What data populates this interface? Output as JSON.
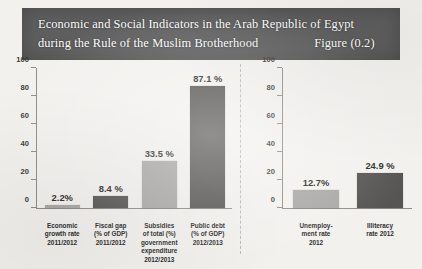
{
  "header": {
    "title_line1": "Economic and Social Indicators in the Arab Republic of Egypt",
    "title_line2": "during the Rule of the Muslim Brotherhood",
    "figure_label": "Figure (0.2)",
    "banner_color": "#5e5e5e",
    "text_color": "#ffffff"
  },
  "palette": {
    "light_bar": "#a9a8a5",
    "dark_bar": "#565553",
    "axis": "#8e8d8a",
    "page_background": "#f2f1ee"
  },
  "chart_data": [
    {
      "type": "bar",
      "id": "left-chart",
      "title": "",
      "xlabel": "",
      "ylabel": "",
      "ylim": [
        0,
        100
      ],
      "yticks": [
        0,
        20,
        40,
        60,
        80,
        100
      ],
      "grid": false,
      "legend": "none",
      "categories": [
        "Economic growth rate 2011/2012",
        "Fiscal gap (% of GDP) 2011/2012",
        "Subsidies of total (%) government expenditure 2012/2013",
        "Public debt (% of GDP) 2012/2013"
      ],
      "category_lines": [
        [
          "Economic",
          "growth rate",
          "2011/2012"
        ],
        [
          "Fiscal gap",
          "(% of GDP)",
          "2011/2012"
        ],
        [
          "Subsidies",
          "of total (%)",
          "government",
          "expenditure",
          "2012/2013"
        ],
        [
          "Public debt",
          "(% of GDP)",
          "2012/2013"
        ]
      ],
      "values": [
        2.2,
        8.4,
        33.5,
        87.1
      ],
      "value_labels": [
        "2.2%",
        "8.4 %",
        "33.5 %",
        "87.1 %"
      ],
      "bar_shades": [
        "light",
        "dark",
        "light",
        "dark"
      ]
    },
    {
      "type": "bar",
      "id": "right-chart",
      "title": "",
      "xlabel": "",
      "ylabel": "",
      "ylim": [
        0,
        100
      ],
      "yticks": [
        0,
        20,
        40,
        60,
        80,
        100
      ],
      "grid": false,
      "legend": "none",
      "categories": [
        "Unemployment rate 2012",
        "Illiteracy rate 2012"
      ],
      "category_lines": [
        [
          "Unemploy-",
          "ment rate",
          "2012"
        ],
        [
          "Illiteracy",
          "rate 2012"
        ]
      ],
      "values": [
        12.7,
        24.9
      ],
      "value_labels": [
        "12.7%",
        "24.9 %"
      ],
      "bar_shades": [
        "light",
        "dark"
      ]
    }
  ]
}
